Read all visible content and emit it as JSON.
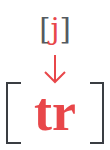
{
  "diagram": {
    "source": {
      "open_bracket": "[",
      "segment": "j",
      "close_bracket": "]"
    },
    "arrow": {
      "icon": "down-arrow-icon",
      "color": "#e8474a"
    },
    "target": {
      "open_bracket": "[",
      "segment": "tr",
      "close_bracket": "]"
    },
    "colors": {
      "accent": "#e8474a",
      "bracket": "#3a3d42"
    }
  }
}
